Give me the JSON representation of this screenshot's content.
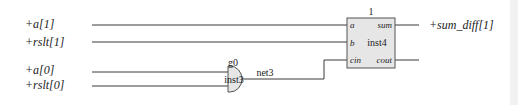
{
  "diagram": {
    "type": "gate-level schematic",
    "colors": {
      "wire": "#3a3a3a",
      "component_fill": "#e6e6e6",
      "component_stroke": "#555555",
      "text": "#222222"
    },
    "inputs": [
      {
        "label": "+a[1]"
      },
      {
        "label": "+rslt[1]"
      },
      {
        "label": "+a[0]"
      },
      {
        "label": "+rslt[0]"
      }
    ],
    "outputs": [
      {
        "label": "+sum_diff[1]"
      }
    ],
    "gate": {
      "type": "AND",
      "name": "g0",
      "instance": "inst3",
      "output_net": "net3"
    },
    "adder": {
      "index_label": "1",
      "instance": "inst4",
      "ports": {
        "a": "a",
        "b": "b",
        "cin": "cin",
        "sum": "sum",
        "cout": "cout"
      }
    }
  }
}
